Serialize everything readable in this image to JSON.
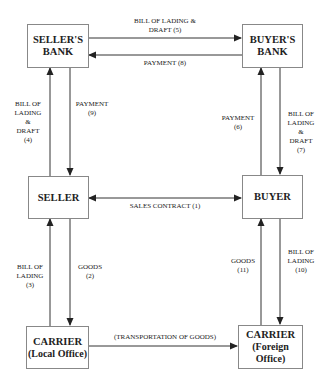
{
  "diagram": {
    "type": "flow",
    "title": "",
    "nodes": {
      "sellers_bank": {
        "line1": "SELLER'S",
        "line2": "BANK"
      },
      "buyers_bank": {
        "line1": "BUYER'S",
        "line2": "BANK"
      },
      "seller": {
        "line1": "SELLER"
      },
      "buyer": {
        "line1": "BUYER"
      },
      "carrier_local": {
        "line1": "CARRIER",
        "line2": "(Local Office)"
      },
      "carrier_foreign": {
        "line1": "CARRIER",
        "line2": "(Foreign Office)"
      }
    },
    "edges": {
      "e1": {
        "from": "seller",
        "to": "buyer",
        "bidirectional": true,
        "line1": "SALES CONTRACT  (1)"
      },
      "e2": {
        "from": "seller",
        "to": "carrier_local",
        "line1": "GOODS",
        "line2": "(2)"
      },
      "e3": {
        "from": "carrier_local",
        "to": "seller",
        "line1": "BILL OF",
        "line2": "LADING",
        "line3": "(3)"
      },
      "e4": {
        "from": "seller",
        "to": "sellers_bank",
        "line1": "BILL OF",
        "line2": "LADING",
        "line3": "&",
        "line4": "DRAFT",
        "line5": "(4)"
      },
      "e5": {
        "from": "sellers_bank",
        "to": "buyers_bank",
        "line1": "BILL OF LADING &",
        "line2": "DRAFT (5)"
      },
      "e6": {
        "from": "buyer",
        "to": "buyers_bank",
        "line1": "PAYMENT",
        "line2": "(6)"
      },
      "e7": {
        "from": "buyers_bank",
        "to": "buyer",
        "line1": "BILL OF",
        "line2": "LADING",
        "line3": "&",
        "line4": "DRAFT",
        "line5": "(7)"
      },
      "e8": {
        "from": "buyers_bank",
        "to": "sellers_bank",
        "line1": "PAYMENT (8)"
      },
      "e9": {
        "from": "sellers_bank",
        "to": "seller",
        "line1": "PAYMENT",
        "line2": "(9)"
      },
      "e10": {
        "from": "buyer",
        "to": "carrier_foreign",
        "line1": "BILL OF",
        "line2": "LADING",
        "line3": "(10)"
      },
      "e11": {
        "from": "carrier_foreign",
        "to": "buyer",
        "line1": "GOODS",
        "line2": "(11)"
      },
      "transport": {
        "from": "carrier_local",
        "to": "carrier_foreign",
        "line1": "(TRANSPORTATION OF GOODS)"
      }
    }
  }
}
